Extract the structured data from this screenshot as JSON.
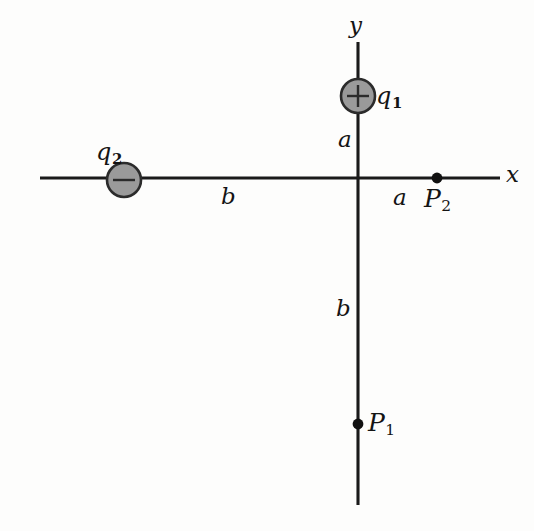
{
  "figure": {
    "type": "physics-diagram",
    "background_color": "#fdfdfc",
    "line_color": "#1a1a1a",
    "charge_fill_color": "#9a9a9a",
    "charge_border_color": "#2b2b2b",
    "dot_color": "#111111"
  },
  "axes": {
    "x_label": "x",
    "y_label": "y",
    "origin": {
      "x": 358,
      "y": 178
    },
    "x_axis": {
      "x1": 40,
      "y1": 178,
      "x2": 500,
      "y2": 178
    },
    "y_axis": {
      "x1": 358,
      "y1": 42,
      "x2": 358,
      "y2": 505
    }
  },
  "charges": [
    {
      "name": "q1",
      "label": "q",
      "subscript": "1",
      "sign": "+",
      "cx": 358,
      "cy": 96,
      "r": 17,
      "label_x": 376,
      "label_y": 84
    },
    {
      "name": "q2",
      "label": "q",
      "subscript": "2",
      "sign": "−",
      "cx": 124,
      "cy": 180,
      "r": 17,
      "label_x": 96,
      "label_y": 140
    }
  ],
  "points": [
    {
      "name": "P1",
      "label": "P",
      "subscript": "1",
      "cx": 358,
      "cy": 424,
      "r": 5,
      "label_x": 368,
      "label_y": 410
    },
    {
      "name": "P2",
      "label": "P",
      "subscript": "2",
      "cx": 437,
      "cy": 178,
      "r": 5,
      "label_x": 424,
      "label_y": 186
    }
  ],
  "distance_labels": [
    {
      "name": "a-above-origin",
      "text": "a",
      "x": 338,
      "y": 128,
      "segment": "origin-to-q1"
    },
    {
      "name": "b-left-of-origin",
      "text": "b",
      "x": 221,
      "y": 185,
      "segment": "q2-to-origin"
    },
    {
      "name": "a-right-of-origin",
      "text": "a",
      "x": 393,
      "y": 186,
      "segment": "origin-to-P2"
    },
    {
      "name": "b-below-origin",
      "text": "b",
      "x": 336,
      "y": 297,
      "segment": "origin-to-P1"
    }
  ],
  "axis_labels": [
    {
      "name": "y-axis-label",
      "text": "y",
      "x": 349,
      "y": 14
    },
    {
      "name": "x-axis-label",
      "text": "x",
      "x": 506,
      "y": 163
    }
  ]
}
